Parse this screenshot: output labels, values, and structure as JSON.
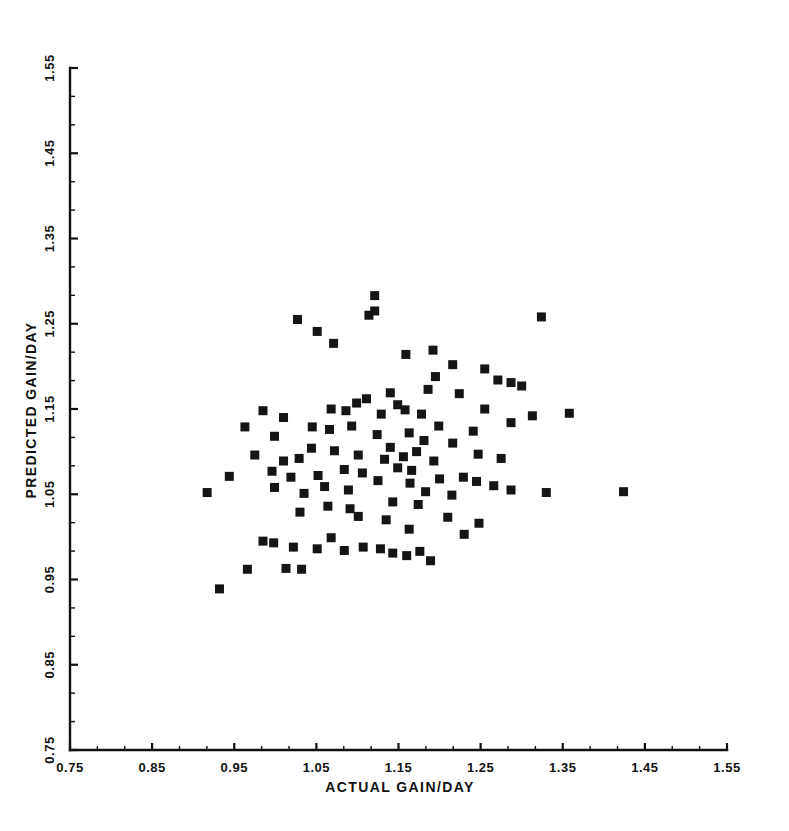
{
  "chart_data": {
    "type": "scatter",
    "title": "",
    "xlabel": "ACTUAL GAIN/DAY",
    "ylabel": "PREDICTED GAIN/DAY",
    "xlim": [
      0.75,
      1.55
    ],
    "ylim": [
      0.75,
      1.55
    ],
    "xticks": [
      0.75,
      0.85,
      0.95,
      1.05,
      1.15,
      1.25,
      1.35,
      1.45,
      1.55
    ],
    "yticks": [
      0.75,
      0.85,
      0.95,
      1.05,
      1.15,
      1.25,
      1.35,
      1.45,
      1.55
    ],
    "xtick_labels": [
      "0.75",
      "0.85",
      "0.95",
      "1.05",
      "1.15",
      "1.25",
      "1.35",
      "1.45",
      "1.55"
    ],
    "ytick_labels": [
      "0.75",
      "0.85",
      "0.95",
      "1.05",
      "1.15",
      "1.25",
      "1.35",
      "1.45",
      "1.55"
    ],
    "minor_ticks_per_interval": 2,
    "grid": false,
    "legend": null,
    "marker": "square",
    "marker_size_px": 9,
    "marker_color": "#151515",
    "n_points": 107,
    "points": [
      [
        1.027,
        1.255
      ],
      [
        1.114,
        1.26
      ],
      [
        1.121,
        1.265
      ],
      [
        1.051,
        1.241
      ],
      [
        1.121,
        1.283
      ],
      [
        1.324,
        1.258
      ],
      [
        1.071,
        1.227
      ],
      [
        1.159,
        1.214
      ],
      [
        1.192,
        1.219
      ],
      [
        1.216,
        1.202
      ],
      [
        1.195,
        1.188
      ],
      [
        1.255,
        1.197
      ],
      [
        1.186,
        1.173
      ],
      [
        1.271,
        1.184
      ],
      [
        1.287,
        1.181
      ],
      [
        1.3,
        1.177
      ],
      [
        1.14,
        1.169
      ],
      [
        1.224,
        1.168
      ],
      [
        1.099,
        1.157
      ],
      [
        1.111,
        1.162
      ],
      [
        1.086,
        1.148
      ],
      [
        1.068,
        1.15
      ],
      [
        0.985,
        1.148
      ],
      [
        1.01,
        1.14
      ],
      [
        1.129,
        1.144
      ],
      [
        1.149,
        1.155
      ],
      [
        1.158,
        1.149
      ],
      [
        1.178,
        1.144
      ],
      [
        1.255,
        1.15
      ],
      [
        1.313,
        1.142
      ],
      [
        1.358,
        1.145
      ],
      [
        1.287,
        1.134
      ],
      [
        1.045,
        1.129
      ],
      [
        1.066,
        1.126
      ],
      [
        1.093,
        1.13
      ],
      [
        0.963,
        1.129
      ],
      [
        0.999,
        1.118
      ],
      [
        1.124,
        1.12
      ],
      [
        1.163,
        1.122
      ],
      [
        1.199,
        1.13
      ],
      [
        1.241,
        1.124
      ],
      [
        1.181,
        1.113
      ],
      [
        1.216,
        1.11
      ],
      [
        1.14,
        1.105
      ],
      [
        1.172,
        1.1
      ],
      [
        1.044,
        1.104
      ],
      [
        1.072,
        1.101
      ],
      [
        1.101,
        1.096
      ],
      [
        1.029,
        1.092
      ],
      [
        0.975,
        1.096
      ],
      [
        1.01,
        1.089
      ],
      [
        1.133,
        1.091
      ],
      [
        1.156,
        1.094
      ],
      [
        1.193,
        1.089
      ],
      [
        1.247,
        1.097
      ],
      [
        1.275,
        1.092
      ],
      [
        1.149,
        1.081
      ],
      [
        1.166,
        1.078
      ],
      [
        1.106,
        1.075
      ],
      [
        1.084,
        1.079
      ],
      [
        1.052,
        1.072
      ],
      [
        1.019,
        1.07
      ],
      [
        0.996,
        1.077
      ],
      [
        0.944,
        1.071
      ],
      [
        1.125,
        1.066
      ],
      [
        1.164,
        1.063
      ],
      [
        1.2,
        1.068
      ],
      [
        1.229,
        1.07
      ],
      [
        1.245,
        1.065
      ],
      [
        1.266,
        1.06
      ],
      [
        1.06,
        1.059
      ],
      [
        1.089,
        1.055
      ],
      [
        1.035,
        1.051
      ],
      [
        0.999,
        1.058
      ],
      [
        1.183,
        1.053
      ],
      [
        1.215,
        1.049
      ],
      [
        1.287,
        1.055
      ],
      [
        1.33,
        1.052
      ],
      [
        1.424,
        1.053
      ],
      [
        0.917,
        1.052
      ],
      [
        1.143,
        1.041
      ],
      [
        1.174,
        1.038
      ],
      [
        1.091,
        1.033
      ],
      [
        1.064,
        1.036
      ],
      [
        1.03,
        1.029
      ],
      [
        1.101,
        1.024
      ],
      [
        1.135,
        1.02
      ],
      [
        1.21,
        1.023
      ],
      [
        1.248,
        1.016
      ],
      [
        1.163,
        1.009
      ],
      [
        1.23,
        1.003
      ],
      [
        1.068,
        0.999
      ],
      [
        0.985,
        0.995
      ],
      [
        0.998,
        0.993
      ],
      [
        1.022,
        0.988
      ],
      [
        1.051,
        0.986
      ],
      [
        1.084,
        0.984
      ],
      [
        1.107,
        0.988
      ],
      [
        1.128,
        0.986
      ],
      [
        1.143,
        0.981
      ],
      [
        1.16,
        0.978
      ],
      [
        1.176,
        0.983
      ],
      [
        1.189,
        0.972
      ],
      [
        0.966,
        0.962
      ],
      [
        1.013,
        0.963
      ],
      [
        1.032,
        0.962
      ],
      [
        0.932,
        0.939
      ]
    ]
  },
  "figure": {
    "background_color": "#ffffff",
    "foreground_color": "#111111"
  }
}
